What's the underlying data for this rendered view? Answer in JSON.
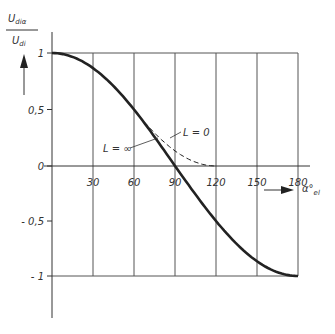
{
  "chart_data": {
    "type": "line",
    "title": "",
    "ylabel_numerator": "U_diα",
    "ylabel_numerator_main": "U",
    "ylabel_numerator_sub": "diα",
    "ylabel_denominator_main": "U",
    "ylabel_denominator_sub": "di",
    "xlabel_main": "α°",
    "xlabel_sub": "el",
    "xlim": [
      0,
      180
    ],
    "ylim": [
      -1,
      1
    ],
    "x_ticks": [
      30,
      60,
      90,
      120,
      150,
      180
    ],
    "x_tick_labels": [
      "30",
      "60",
      "90",
      "120",
      "150",
      "180"
    ],
    "y_ticks": [
      1,
      0.5,
      0,
      -0.5,
      -1
    ],
    "y_tick_labels": [
      "1",
      "0,5",
      "0",
      "- 0,5",
      "- 1"
    ],
    "grid": {
      "vertical": true,
      "horizontal_at": [
        1,
        -1
      ]
    },
    "series": [
      {
        "name": "L = ∞",
        "style": "solid",
        "x": [
          0,
          15,
          30,
          45,
          60,
          75,
          90,
          105,
          120,
          135,
          150,
          165,
          180
        ],
        "values": [
          1.0,
          0.966,
          0.866,
          0.707,
          0.5,
          0.259,
          0.0,
          -0.259,
          -0.5,
          -0.707,
          -0.866,
          -0.966,
          -1.0
        ]
      },
      {
        "name": "L = 0",
        "style": "dashed",
        "x": [
          60,
          75,
          90,
          105,
          120
        ],
        "values": [
          0.5,
          0.293,
          0.134,
          0.034,
          0.0
        ]
      }
    ],
    "annotations": [
      "L = ∞",
      "L = 0"
    ]
  },
  "labels": {
    "l_inf": "L = ∞",
    "l_zero": "L = 0"
  },
  "colors": {
    "curve": "#222222",
    "grid": "#555555",
    "text": "#333333"
  }
}
